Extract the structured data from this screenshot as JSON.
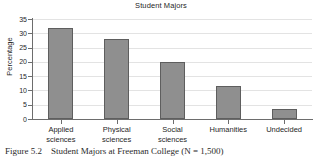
{
  "figure": {
    "caption_label": "Figure 5.2",
    "caption_text": "Student Majors at Freeman College (N = 1,500)"
  },
  "chart_data": {
    "type": "bar",
    "title": "Student Majors",
    "xlabel": "",
    "ylabel": "Percentage",
    "categories": [
      "Applied sciences",
      "Physical sciences",
      "Social sciences",
      "Humanities",
      "Undecided"
    ],
    "category_lines": [
      [
        "Applied",
        "sciences"
      ],
      [
        "Physical",
        "sciences"
      ],
      [
        "Social",
        "sciences"
      ],
      [
        "Humanities",
        ""
      ],
      [
        "Undecided",
        ""
      ]
    ],
    "values": [
      32.0,
      28.0,
      19.8,
      11.5,
      3.5
    ],
    "ylim": [
      0,
      35
    ],
    "ytick_values": [
      0,
      5,
      10,
      15,
      20,
      25,
      30,
      35
    ],
    "ytick_labels": [
      "0",
      "5",
      "10",
      "15",
      "20",
      "25",
      "30",
      "35"
    ],
    "grid": true,
    "grid_axis": "y",
    "legend": false,
    "bar_color": "#8f8f8f",
    "bar_edge_color": "#5e5e5e",
    "grid_color": "#e3e3e3",
    "axis_color": "#6d6d6d"
  }
}
